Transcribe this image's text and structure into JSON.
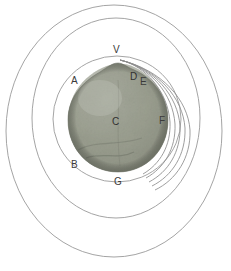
{
  "figure": {
    "background_color": "#ffffff",
    "line_color": "#8a8a8a",
    "label_color": "#3a3a3a",
    "sphere": {
      "name": "textured-sphere",
      "center_x": 118,
      "center_y": 118,
      "radius_x": 50,
      "radius_y": 54,
      "fill_light": "#b9bcb2",
      "fill_mid": "#8e9288",
      "fill_dark": "#6d7167",
      "highlight_x": 98,
      "highlight_y": 98
    },
    "ellipses": [
      {
        "name": "outer-ellipse",
        "cx": 114,
        "cy": 131,
        "rx": 108,
        "ry": 126
      },
      {
        "name": "middle-ellipse",
        "cx": 116,
        "cy": 118,
        "rx": 84,
        "ry": 100
      },
      {
        "name": "inner-ellipse",
        "cx": 117,
        "cy": 119,
        "rx": 64,
        "ry": 63
      }
    ],
    "arcs": {
      "name": "vertex-arc-fan",
      "count": 5,
      "origin_label": "V"
    },
    "labels": [
      {
        "id": "V",
        "text": "V",
        "x": 113,
        "y": 45,
        "on_dark": false
      },
      {
        "id": "A",
        "text": "A",
        "x": 71,
        "y": 76,
        "on_dark": false
      },
      {
        "id": "D",
        "text": "D",
        "x": 130,
        "y": 72,
        "on_dark": true
      },
      {
        "id": "E",
        "text": "E",
        "x": 140,
        "y": 77,
        "on_dark": false
      },
      {
        "id": "C",
        "text": "C",
        "x": 112,
        "y": 117,
        "on_dark": true
      },
      {
        "id": "F",
        "text": "F",
        "x": 159,
        "y": 116,
        "on_dark": false
      },
      {
        "id": "B",
        "text": "B",
        "x": 71,
        "y": 160,
        "on_dark": false
      },
      {
        "id": "G",
        "text": "G",
        "x": 114,
        "y": 177,
        "on_dark": false
      }
    ]
  }
}
